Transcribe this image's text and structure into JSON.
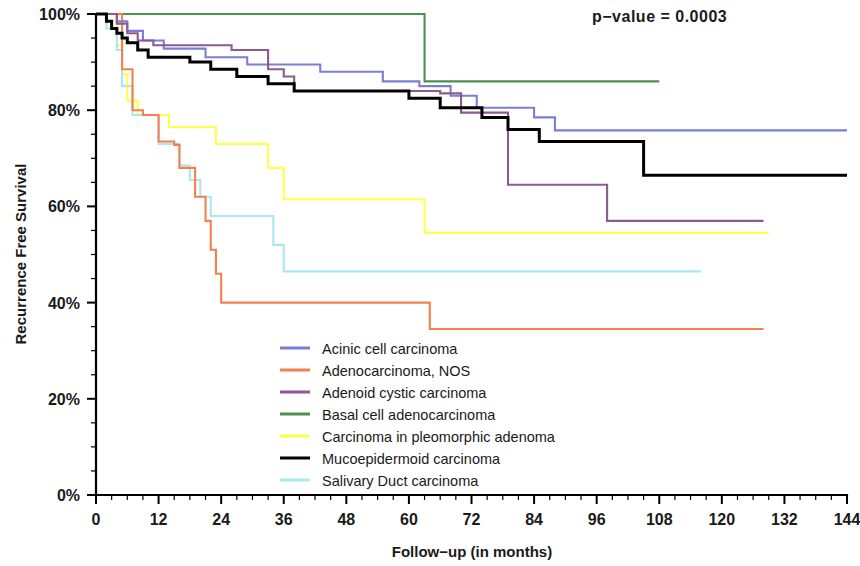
{
  "chart_data": {
    "type": "line",
    "title": "",
    "subtitle": "",
    "xlabel": "Follow−up (in months)",
    "ylabel": "Recurrence Free Survival",
    "xlim": [
      0,
      144
    ],
    "ylim": [
      0,
      100
    ],
    "xticks": [
      0,
      12,
      24,
      36,
      48,
      60,
      72,
      84,
      96,
      108,
      120,
      132,
      144
    ],
    "xtick_labels": [
      "0",
      "12",
      "24",
      "36",
      "48",
      "60",
      "72",
      "84",
      "96",
      "108",
      "120",
      "132",
      "144"
    ],
    "yticks": [
      0,
      20,
      40,
      60,
      80,
      100
    ],
    "ytick_labels": [
      "0%",
      "20%",
      "40%",
      "60%",
      "80%",
      "100%"
    ],
    "grid": false,
    "legend_position": "center-bottom-inside",
    "annotations": [
      {
        "name": "p-value",
        "text": "p−value  =  0.0003",
        "x": 96,
        "y": 98
      }
    ],
    "series": [
      {
        "name": "Acinic cell carcinoma",
        "color": "#7b7fd4",
        "steps": [
          [
            0,
            100
          ],
          [
            4,
            100
          ],
          [
            4,
            98.5
          ],
          [
            6,
            98.5
          ],
          [
            6,
            96.5
          ],
          [
            9,
            96.5
          ],
          [
            9,
            94.5
          ],
          [
            13,
            94.5
          ],
          [
            13,
            92.8
          ],
          [
            21,
            92.8
          ],
          [
            21,
            91.0
          ],
          [
            29,
            91.0
          ],
          [
            29,
            89.5
          ],
          [
            43,
            89.5
          ],
          [
            43,
            88.0
          ],
          [
            55,
            88.0
          ],
          [
            55,
            86.0
          ],
          [
            62,
            86.0
          ],
          [
            62,
            85.0
          ],
          [
            68,
            85.0
          ],
          [
            68,
            83.0
          ],
          [
            73,
            83.0
          ],
          [
            73,
            80.5
          ],
          [
            84,
            80.5
          ],
          [
            84,
            78.5
          ],
          [
            88,
            78.5
          ],
          [
            88,
            75.8
          ],
          [
            144,
            75.8
          ]
        ]
      },
      {
        "name": "Adenocarcinoma, NOS",
        "color": "#f4804f",
        "steps": [
          [
            0,
            100
          ],
          [
            5,
            100
          ],
          [
            5,
            88.5
          ],
          [
            7,
            88.5
          ],
          [
            7,
            80.0
          ],
          [
            9,
            80.0
          ],
          [
            9,
            79.0
          ],
          [
            12,
            79.0
          ],
          [
            12,
            73.5
          ],
          [
            15,
            73.5
          ],
          [
            15,
            72.8
          ],
          [
            16,
            72.8
          ],
          [
            16,
            68.0
          ],
          [
            19,
            68.0
          ],
          [
            19,
            62.0
          ],
          [
            21,
            62.0
          ],
          [
            21,
            57.0
          ],
          [
            22,
            57.0
          ],
          [
            22,
            51.0
          ],
          [
            23,
            51.0
          ],
          [
            23,
            46.0
          ],
          [
            24,
            46.0
          ],
          [
            24,
            40.0
          ],
          [
            64,
            40.0
          ],
          [
            64,
            34.5
          ],
          [
            128,
            34.5
          ]
        ]
      },
      {
        "name": "Adenoid cystic carcinoma",
        "color": "#8b5a8f",
        "steps": [
          [
            0,
            100
          ],
          [
            4,
            100
          ],
          [
            4,
            98.0
          ],
          [
            6,
            98.0
          ],
          [
            6,
            96.0
          ],
          [
            8,
            96.0
          ],
          [
            8,
            94.5
          ],
          [
            11,
            94.5
          ],
          [
            11,
            93.5
          ],
          [
            26,
            93.5
          ],
          [
            26,
            92.5
          ],
          [
            33,
            92.5
          ],
          [
            33,
            88.5
          ],
          [
            36,
            88.5
          ],
          [
            36,
            87.0
          ],
          [
            38,
            87.0
          ],
          [
            38,
            84.0
          ],
          [
            66,
            84.0
          ],
          [
            66,
            83.5
          ],
          [
            70,
            83.5
          ],
          [
            70,
            79.5
          ],
          [
            79,
            79.5
          ],
          [
            79,
            64.5
          ],
          [
            98,
            64.5
          ],
          [
            98,
            57.0
          ],
          [
            128,
            57.0
          ]
        ]
      },
      {
        "name": "Basal cell adenocarcinoma",
        "color": "#4f8f4f",
        "steps": [
          [
            0,
            100
          ],
          [
            63,
            100
          ],
          [
            63,
            86.0
          ],
          [
            108,
            86.0
          ]
        ]
      },
      {
        "name": "Carcinoma in pleomorphic adenoma",
        "color": "#ffff4d",
        "steps": [
          [
            0,
            100
          ],
          [
            4,
            100
          ],
          [
            4,
            93.5
          ],
          [
            5,
            93.5
          ],
          [
            5,
            87.5
          ],
          [
            6,
            87.5
          ],
          [
            6,
            82.0
          ],
          [
            8,
            82.0
          ],
          [
            8,
            79.0
          ],
          [
            14,
            79.0
          ],
          [
            14,
            76.5
          ],
          [
            23,
            76.5
          ],
          [
            23,
            73.0
          ],
          [
            33,
            73.0
          ],
          [
            33,
            68.0
          ],
          [
            36,
            68.0
          ],
          [
            36,
            61.5
          ],
          [
            63,
            61.5
          ],
          [
            63,
            54.5
          ],
          [
            129,
            54.5
          ]
        ]
      },
      {
        "name": "Mucoepidermoid carcinoma",
        "color": "#000000",
        "steps": [
          [
            0,
            100
          ],
          [
            2,
            100
          ],
          [
            2,
            98.5
          ],
          [
            3,
            98.5
          ],
          [
            3,
            97.0
          ],
          [
            4,
            97.0
          ],
          [
            4,
            96.0
          ],
          [
            5,
            96.0
          ],
          [
            5,
            95.0
          ],
          [
            6,
            95.0
          ],
          [
            6,
            94.0
          ],
          [
            8,
            94.0
          ],
          [
            8,
            92.5
          ],
          [
            10,
            92.5
          ],
          [
            10,
            91.0
          ],
          [
            18,
            91.0
          ],
          [
            18,
            90.0
          ],
          [
            22,
            90.0
          ],
          [
            22,
            88.5
          ],
          [
            27,
            88.5
          ],
          [
            27,
            87.0
          ],
          [
            33,
            87.0
          ],
          [
            33,
            85.5
          ],
          [
            38,
            85.5
          ],
          [
            38,
            84.0
          ],
          [
            60,
            84.0
          ],
          [
            60,
            82.5
          ],
          [
            66,
            82.5
          ],
          [
            66,
            80.5
          ],
          [
            74,
            80.5
          ],
          [
            74,
            78.5
          ],
          [
            79,
            78.5
          ],
          [
            79,
            76.0
          ],
          [
            85,
            76.0
          ],
          [
            85,
            73.5
          ],
          [
            105,
            73.5
          ],
          [
            105,
            66.5
          ],
          [
            144,
            66.5
          ]
        ]
      },
      {
        "name": "Salivary Duct carcinoma",
        "color": "#a8e8f0",
        "steps": [
          [
            0,
            100
          ],
          [
            2,
            100
          ],
          [
            2,
            97.0
          ],
          [
            4,
            97.0
          ],
          [
            4,
            92.5
          ],
          [
            5,
            92.5
          ],
          [
            5,
            85.0
          ],
          [
            7,
            85.0
          ],
          [
            7,
            79.0
          ],
          [
            12,
            79.0
          ],
          [
            12,
            73.0
          ],
          [
            16,
            73.0
          ],
          [
            16,
            68.5
          ],
          [
            18,
            68.5
          ],
          [
            18,
            65.5
          ],
          [
            20,
            65.5
          ],
          [
            20,
            62.0
          ],
          [
            22,
            62.0
          ],
          [
            22,
            58.0
          ],
          [
            34,
            58.0
          ],
          [
            34,
            52.0
          ],
          [
            36,
            52.0
          ],
          [
            36,
            46.5
          ],
          [
            116,
            46.5
          ]
        ]
      }
    ]
  },
  "legend": {
    "entries": [
      {
        "label": "Acinic cell carcinoma",
        "color": "#7b7fd4"
      },
      {
        "label": "Adenocarcinoma, NOS",
        "color": "#f4804f"
      },
      {
        "label": "Adenoid cystic carcinoma",
        "color": "#8b5a8f"
      },
      {
        "label": "Basal cell adenocarcinoma",
        "color": "#4f8f4f"
      },
      {
        "label": "Carcinoma in pleomorphic adenoma",
        "color": "#ffff4d"
      },
      {
        "label": "Mucoepidermoid carcinoma",
        "color": "#000000"
      },
      {
        "label": "Salivary Duct carcinoma",
        "color": "#a8e8f0"
      }
    ]
  },
  "statistics": {
    "p_value_text": "p−value  =  0.0003",
    "p_value": "0.0003"
  }
}
